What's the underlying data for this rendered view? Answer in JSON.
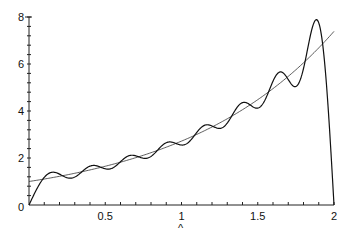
{
  "chart_data": {
    "type": "line",
    "title": "",
    "xlabel": "",
    "ylabel": "",
    "xlim": [
      0,
      2
    ],
    "ylim": [
      0,
      8
    ],
    "grid": false,
    "legend": null,
    "x_ticks": [
      "0.5",
      "1",
      "1.5",
      "2"
    ],
    "y_ticks": [
      "0",
      "2",
      "4",
      "6",
      "8"
    ],
    "annotations": [
      "^"
    ],
    "series": [
      {
        "name": "e^x",
        "style": "thin",
        "x": [
          0,
          0.25,
          0.5,
          0.75,
          1.0,
          1.25,
          1.5,
          1.75,
          2.0
        ],
        "values": [
          1.0,
          1.28,
          1.65,
          2.12,
          2.72,
          3.49,
          4.48,
          5.75,
          7.39
        ]
      },
      {
        "name": "sine Fourier partial sum of e^x (N=16)",
        "style": "oscillating",
        "terms": 16,
        "x": [
          0,
          0.12,
          0.25,
          0.37,
          0.5,
          0.62,
          0.75,
          0.87,
          1.0,
          1.12,
          1.25,
          1.37,
          1.5,
          1.62,
          1.75,
          1.89,
          2.0
        ],
        "values": [
          0,
          1.35,
          1.15,
          1.6,
          1.45,
          2.0,
          1.95,
          2.5,
          2.4,
          3.25,
          3.1,
          4.2,
          4.0,
          5.5,
          4.9,
          7.8,
          0
        ]
      }
    ]
  },
  "axes": {
    "origin_label": "0",
    "x_labels": [
      {
        "v": 0.5,
        "t": "0.5"
      },
      {
        "v": 1,
        "t": "1"
      },
      {
        "v": 1.5,
        "t": "1.5"
      },
      {
        "v": 2,
        "t": "2"
      }
    ],
    "y_labels": [
      {
        "v": 2,
        "t": "2"
      },
      {
        "v": 4,
        "t": "4"
      },
      {
        "v": 6,
        "t": "6"
      },
      {
        "v": 8,
        "t": "8"
      }
    ],
    "marker_text": "^"
  }
}
